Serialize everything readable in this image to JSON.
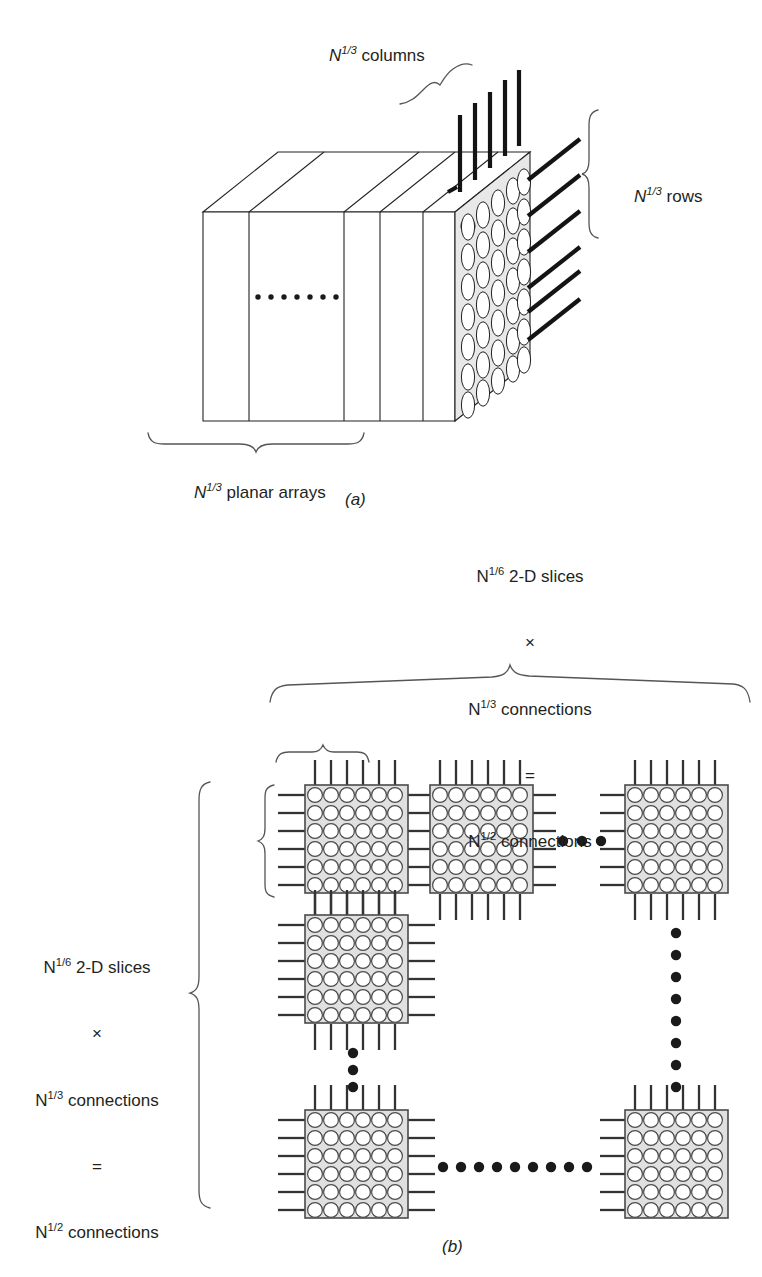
{
  "figure": {
    "kind": "two-panel technical diagram",
    "panels": [
      {
        "id": "a",
        "caption": "(a)",
        "subject": "3-D stack of planar arrays"
      },
      {
        "id": "b",
        "caption": "(b)",
        "subject": "2-D mesh of 2-D slices"
      }
    ]
  },
  "panel_a": {
    "caption": "(a)",
    "label_columns_prefix": "N",
    "label_columns_exp": "1/3",
    "label_columns_suffix": " columns",
    "label_rows_prefix": "N",
    "label_rows_exp": "1/3",
    "label_rows_suffix": " rows",
    "label_planar_prefix": "N",
    "label_planar_exp": "1/3",
    "label_planar_suffix": " planar arrays",
    "grid": {
      "columns": 5,
      "rows": 7
    },
    "planar_array_slabs": 6,
    "top_connections": 5,
    "right_connections": 7,
    "ellipsis_dots": 7,
    "colors": {
      "outline": "#231f20",
      "face_fill": "#e8e8e8",
      "slab_fill": "#ffffff",
      "connection": "#141414"
    }
  },
  "panel_b": {
    "caption": "(b)",
    "top_label": {
      "line1_prefix": "N",
      "line1_exp": "1/6",
      "line1_suffix": " 2-D slices",
      "line2": "×",
      "line3_prefix": "N",
      "line3_exp": "1/3",
      "line3_suffix": " connections",
      "line4": "=",
      "line5_prefix": "N",
      "line5_exp": "1/2",
      "line5_suffix": " connections"
    },
    "left_label": {
      "line1_prefix": "N",
      "line1_exp": "1/6",
      "line1_suffix": " 2-D slices",
      "line2": "×",
      "line3_prefix": "N",
      "line3_exp": "1/3",
      "line3_suffix": " connections",
      "line4": "=",
      "line5_prefix": "N",
      "line5_exp": "1/2",
      "line5_suffix": " connections"
    },
    "module": {
      "grid_cols": 6,
      "grid_rows": 6,
      "stubs_per_side": 6
    },
    "modules_visible": 6,
    "horizontal_ellipsis_top_dots": 3,
    "horizontal_ellipsis_bottom_dots": 11,
    "vertical_ellipsis_left_dots": 3,
    "vertical_ellipsis_right_dots": 8,
    "colors": {
      "outline": "#4a4a4a",
      "module_fill": "#e0e0e0",
      "circle_fill": "#ffffff",
      "stub": "#333333",
      "dot": "#1a1a1a",
      "brace": "#555555"
    }
  }
}
